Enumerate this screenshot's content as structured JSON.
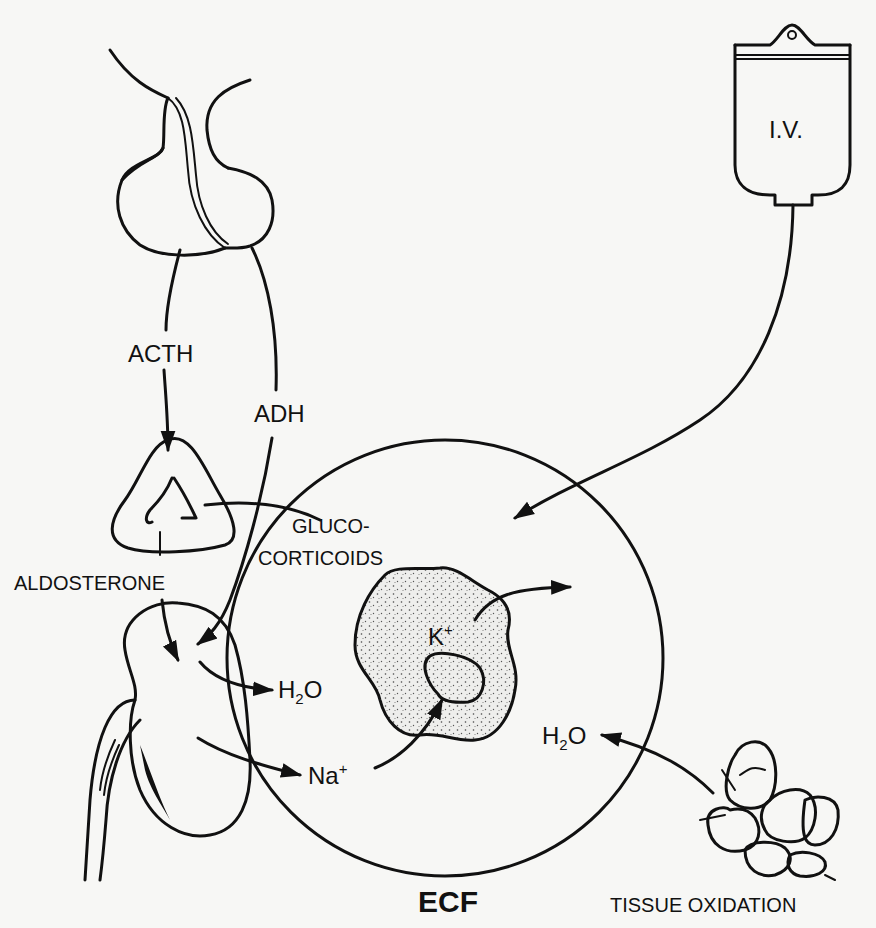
{
  "diagram": {
    "labels": {
      "iv": "I.V.",
      "acth": "ACTH",
      "adh": "ADH",
      "aldosterone": "ALDOSTERONE",
      "gluco_line1": "GLUCO-",
      "gluco_line2": "CORTICOIDS",
      "potassium": "K",
      "potassium_charge": "+",
      "water_kidney_h": "H",
      "water_kidney_sub": "2",
      "water_kidney_o": "O",
      "sodium": "Na",
      "sodium_charge": "+",
      "water_tissue_h": "H",
      "water_tissue_sub": "2",
      "water_tissue_o": "O",
      "ecf": "ECF",
      "tissue_oxidation": "TISSUE OXIDATION"
    },
    "components": [
      "pituitary-gland",
      "adrenal-gland",
      "kidney",
      "ecf-compartment",
      "cell",
      "iv-bag",
      "tissue-cells"
    ],
    "flows": [
      {
        "from": "pituitary-gland",
        "to": "adrenal-gland",
        "label": "ACTH"
      },
      {
        "from": "pituitary-gland",
        "to": "kidney",
        "label": "ADH"
      },
      {
        "from": "adrenal-gland",
        "to": "kidney",
        "label": "ALDOSTERONE"
      },
      {
        "from": "adrenal-gland",
        "to": "cell",
        "label": "GLUCO-CORTICOIDS"
      },
      {
        "from": "kidney",
        "to": "ecf-compartment",
        "label": "H2O"
      },
      {
        "from": "kidney",
        "to": "ecf-compartment",
        "label": "Na+"
      },
      {
        "from": "ecf-compartment",
        "to": "cell",
        "label": "Na+"
      },
      {
        "from": "cell",
        "to": "ecf-compartment",
        "label": "K+"
      },
      {
        "from": "iv-bag",
        "to": "ecf-compartment",
        "label": ""
      },
      {
        "from": "tissue-cells",
        "to": "ecf-compartment",
        "label": "H2O"
      }
    ]
  }
}
